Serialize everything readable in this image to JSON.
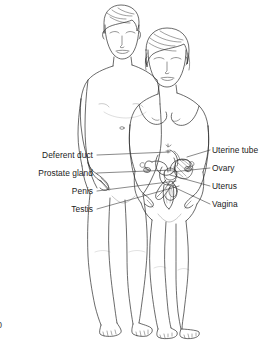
{
  "figure": {
    "kind": "anatomical-line-drawing",
    "background_color": "#ffffff",
    "line_color": "#2b2b2b",
    "leader_line_color": "#3a3a3a",
    "subjects": [
      {
        "id": "male-figure",
        "side": "left",
        "label_side": "left"
      },
      {
        "id": "female-figure",
        "side": "right",
        "label_side": "right"
      }
    ]
  },
  "labels": {
    "left": [
      {
        "id": "deferent-duct",
        "text": "Deferent duct",
        "x": 95,
        "y": 157,
        "leader_to_x": 170,
        "leader_to_y": 152
      },
      {
        "id": "prostate-gland",
        "text": "Prostate gland",
        "x": 95,
        "y": 176,
        "leader_to_x": 173,
        "leader_to_y": 170
      },
      {
        "id": "penis",
        "text": "Penis",
        "x": 95,
        "y": 194,
        "leader_to_x": 178,
        "leader_to_y": 180
      },
      {
        "id": "testis",
        "text": "Testis",
        "x": 95,
        "y": 212,
        "leader_to_x": 180,
        "leader_to_y": 186
      }
    ],
    "right": [
      {
        "id": "uterine-tube",
        "text": "Uterine tube",
        "x": 212,
        "y": 152,
        "leader_to_x": 186,
        "leader_to_y": 157
      },
      {
        "id": "ovary",
        "text": "Ovary",
        "x": 212,
        "y": 171,
        "leader_to_x": 170,
        "leader_to_y": 172
      },
      {
        "id": "uterus",
        "text": "Uterus",
        "x": 212,
        "y": 189,
        "leader_to_x": 168,
        "leader_to_y": 174
      },
      {
        "id": "vagina",
        "text": "Vagina",
        "x": 212,
        "y": 207,
        "leader_to_x": 166,
        "leader_to_y": 183
      }
    ]
  },
  "page_mark": {
    "text": "0"
  }
}
